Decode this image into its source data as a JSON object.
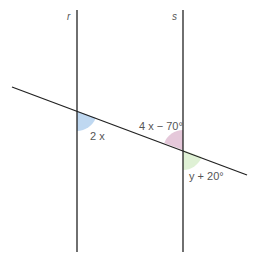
{
  "diagram": {
    "type": "parallel-lines-transversal",
    "lines": [
      {
        "id": "r",
        "label": "r"
      },
      {
        "id": "s",
        "label": "s"
      }
    ],
    "angles": [
      {
        "id": "angle-2x",
        "label": "2 x",
        "color": "#b8d4f0",
        "position": "line r, below-right of transversal"
      },
      {
        "id": "angle-4x-70",
        "label": "4 x − 70°",
        "color": "#e2c2d6",
        "position": "line s, above-left of transversal"
      },
      {
        "id": "angle-y-20",
        "label": "y + 20°",
        "color": "#dcefd0",
        "position": "line s, below-right of transversal"
      }
    ],
    "line_color": "#222222"
  }
}
